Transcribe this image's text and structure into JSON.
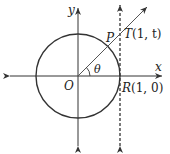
{
  "figure": {
    "type": "unit-circle-tangent-diagram",
    "labels": {
      "y_axis": "y",
      "x_axis": "x",
      "origin": "O",
      "point_p": "P",
      "point_t": "T(1, t)",
      "point_t_name": "T",
      "point_t_coords": "(1, t)",
      "point_r": "R(1, 0)",
      "point_r_name": "R",
      "point_r_coords": "(1, 0)",
      "angle": "θ"
    },
    "elements": {
      "circle": "unit circle centered at O",
      "tangent_line": "dashed vertical line x = 1 through R",
      "ray": "ray from O through P to T",
      "angle_arc": "arc marking angle θ between positive x-axis and ray"
    },
    "colors": {
      "stroke": "#333333",
      "text": "#222222",
      "background": "#ffffff"
    }
  }
}
